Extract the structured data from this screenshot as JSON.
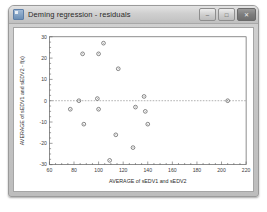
{
  "window": {
    "title": "Deming regression - residuals",
    "icon": "chart-window-icon",
    "controls": {
      "minimize_label": "–",
      "maximize_label": "□",
      "close_label": "✕"
    }
  },
  "chart_data": {
    "type": "scatter",
    "title": "",
    "xlabel": "AVERAGE of sEDV1 and sEDV2",
    "ylabel": "AVERAGE of sEDV1 and sEDV2 - f(x)",
    "xlim": [
      60,
      220
    ],
    "ylim": [
      -30,
      30
    ],
    "xticks": [
      60,
      80,
      100,
      120,
      140,
      160,
      180,
      200,
      220
    ],
    "yticks": [
      30,
      20,
      10,
      0,
      -10,
      -20,
      -30
    ],
    "xtick_labels": [
      "60",
      "80",
      "100",
      "120",
      "140",
      "160",
      "180",
      "200",
      "220"
    ],
    "ytick_labels": [
      "30",
      "20",
      "10",
      "0",
      "-10",
      "-20",
      "-30"
    ],
    "grid": false,
    "legend": null,
    "reference_lines": [
      {
        "name": "zero-residual-line",
        "axis": "y",
        "value": 0,
        "style": "dashed"
      }
    ],
    "marker": "open-circle",
    "marker_color": "#5c5c5c",
    "points": [
      {
        "x": 87,
        "y": 22
      },
      {
        "x": 104,
        "y": 27
      },
      {
        "x": 100,
        "y": 22
      },
      {
        "x": 116,
        "y": 15
      },
      {
        "x": 84,
        "y": 0
      },
      {
        "x": 99,
        "y": 1
      },
      {
        "x": 77,
        "y": -4
      },
      {
        "x": 100,
        "y": -4
      },
      {
        "x": 130,
        "y": -3
      },
      {
        "x": 137,
        "y": 2
      },
      {
        "x": 205,
        "y": 0
      },
      {
        "x": 88,
        "y": -11
      },
      {
        "x": 140,
        "y": -11
      },
      {
        "x": 138,
        "y": -5
      },
      {
        "x": 114,
        "y": -16
      },
      {
        "x": 128,
        "y": -22
      },
      {
        "x": 109,
        "y": -28
      }
    ]
  }
}
